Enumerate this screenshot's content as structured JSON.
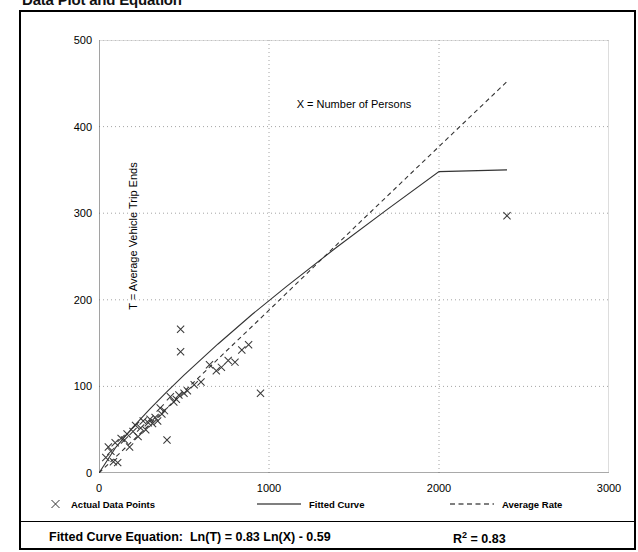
{
  "page": {
    "title": "Data Plot and Equation"
  },
  "legend": {
    "items": [
      {
        "label": "Actual Data Points",
        "style": "marker-x",
        "icon": "x-marker-icon"
      },
      {
        "label": "Fitted Curve",
        "style": "solid-line",
        "icon": "solid-line-icon"
      },
      {
        "label": "Average Rate",
        "style": "dashed-line",
        "icon": "dashed-line-icon"
      }
    ]
  },
  "equation": {
    "label": "Fitted Curve Equation:",
    "expression": "Ln(T) = 0.83 Ln(X) - 0.59",
    "r_squared_label": "R",
    "r_squared_exponent": "2",
    "r_squared_value": "= 0.83"
  },
  "chart_data": {
    "type": "scatter",
    "title": "Data Plot and Equation",
    "xlabel": "X = Number of Persons",
    "ylabel": "T = Average Vehicle Trip Ends",
    "xlim": [
      0,
      3000
    ],
    "ylim": [
      0,
      500
    ],
    "xticks": [
      0,
      1000,
      2000,
      3000
    ],
    "yticks": [
      0,
      100,
      200,
      300,
      400,
      500
    ],
    "x_minor_tick_step": 500,
    "y_minor_tick_step": 50,
    "grid": true,
    "grid_style": "dotted",
    "legend_position": "below-plot",
    "series": [
      {
        "name": "Actual Data Points",
        "type": "scatter",
        "marker": "x",
        "points": [
          [
            40,
            18
          ],
          [
            55,
            30
          ],
          [
            70,
            25
          ],
          [
            85,
            13
          ],
          [
            95,
            35
          ],
          [
            110,
            12
          ],
          [
            130,
            40
          ],
          [
            150,
            38
          ],
          [
            165,
            45
          ],
          [
            180,
            30
          ],
          [
            200,
            48
          ],
          [
            215,
            55
          ],
          [
            230,
            42
          ],
          [
            245,
            52
          ],
          [
            260,
            60
          ],
          [
            275,
            50
          ],
          [
            290,
            58
          ],
          [
            300,
            62
          ],
          [
            315,
            57
          ],
          [
            330,
            64
          ],
          [
            345,
            60
          ],
          [
            360,
            75
          ],
          [
            370,
            68
          ],
          [
            385,
            72
          ],
          [
            400,
            38
          ],
          [
            420,
            88
          ],
          [
            440,
            82
          ],
          [
            455,
            85
          ],
          [
            470,
            90
          ],
          [
            480,
            140
          ],
          [
            480,
            166
          ],
          [
            500,
            92
          ],
          [
            520,
            95
          ],
          [
            560,
            102
          ],
          [
            600,
            105
          ],
          [
            650,
            125
          ],
          [
            690,
            118
          ],
          [
            720,
            122
          ],
          [
            760,
            130
          ],
          [
            800,
            128
          ],
          [
            840,
            142
          ],
          [
            880,
            148
          ],
          [
            950,
            92
          ],
          [
            2400,
            297
          ]
        ]
      },
      {
        "name": "Fitted Curve",
        "type": "line",
        "style": "solid",
        "equation": "Ln(T) = 0.83 Ln(X) - 0.59",
        "points": [
          [
            0,
            0
          ],
          [
            100,
            30
          ],
          [
            200,
            53
          ],
          [
            300,
            74
          ],
          [
            400,
            94
          ],
          [
            500,
            113
          ],
          [
            700,
            149
          ],
          [
            900,
            183
          ],
          [
            1100,
            215
          ],
          [
            1400,
            261
          ],
          [
            1700,
            305
          ],
          [
            2000,
            348
          ],
          [
            2400,
            350
          ]
        ]
      },
      {
        "name": "Average Rate",
        "type": "line",
        "style": "dashed",
        "points": [
          [
            0,
            0
          ],
          [
            500,
            94
          ],
          [
            1000,
            188
          ],
          [
            1500,
            283
          ],
          [
            2000,
            377
          ],
          [
            2400,
            452
          ]
        ]
      }
    ]
  }
}
